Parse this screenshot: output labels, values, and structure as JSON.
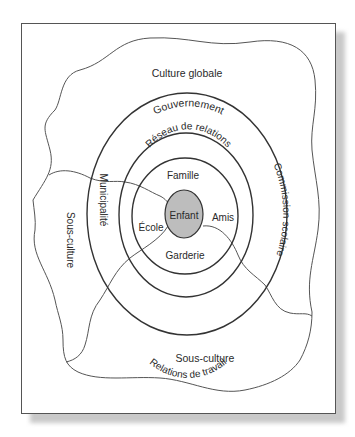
{
  "diagram": {
    "type": "ecological-systems-model",
    "colors": {
      "line": "#333333",
      "wavy_line": "#555555",
      "center_fill": "#bdbdbd",
      "frame": "#555555",
      "background": "#ffffff"
    },
    "regions": {
      "outer": "Culture globale",
      "subculture_left": "Sous-culture",
      "subculture_bottom": "Sous-culture"
    },
    "rings": {
      "outer_ring": {
        "top": "Gouvernement",
        "left": "Municipalité",
        "right": "Commission scolaire",
        "bottom": "Relations de travail"
      },
      "middle_ring": {
        "top": "Réseau de relations"
      },
      "inner_ring": {
        "top": "Famille",
        "left": "École",
        "right": "Amis",
        "bottom": "Garderie"
      }
    },
    "center": "Enfant"
  }
}
